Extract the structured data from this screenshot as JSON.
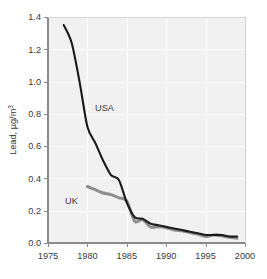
{
  "figure": {
    "background_color": "#ffffff",
    "plot_background_color": "#f1f1f1",
    "gridline_color": "#ffffff",
    "axis_color": "#8a8a8a",
    "text_color": "#3a3a3a"
  },
  "axis": {
    "y_title_main": "Lead, ",
    "y_title_unit": "µg/m",
    "y_title_exp": "3",
    "y_title_full": "Lead, µg/m3",
    "x_title": "",
    "y_ticks": [
      "1.4",
      "1.2",
      "1.0",
      "0.8",
      "0.6",
      "0.4",
      "0.2",
      "0.0"
    ],
    "x_ticks": [
      "1975",
      "1980",
      "1985",
      "1990",
      "1995",
      "2000"
    ]
  },
  "labels": {
    "usa": "USA",
    "uk": "UK"
  },
  "chart_data": {
    "type": "line",
    "title": "",
    "subtitle": "",
    "xlabel": "",
    "ylabel": "Lead, µg/m3",
    "xlim": [
      1975,
      2000
    ],
    "ylim": [
      0.0,
      1.4
    ],
    "xticks": [
      1975,
      1980,
      1985,
      1990,
      1995,
      2000
    ],
    "yticks": [
      0.0,
      0.2,
      0.4,
      0.6,
      0.8,
      1.0,
      1.2,
      1.4
    ],
    "grid": true,
    "grid_axes": "both",
    "legend": "inline-annotations",
    "annotations": [
      {
        "text": "USA",
        "x": 1981.2,
        "y": 0.8
      },
      {
        "text": "UK",
        "x": 1979.6,
        "y": 0.29
      }
    ],
    "series": [
      {
        "name": "USA",
        "color": "#1a1a1a",
        "linewidth": 2.1,
        "x": [
          1977,
          1978,
          1979,
          1980,
          1981,
          1982,
          1983,
          1984,
          1985,
          1986,
          1987,
          1988,
          1989,
          1990,
          1991,
          1992,
          1993,
          1994,
          1995,
          1996,
          1997,
          1998,
          1999
        ],
        "y": [
          1.35,
          1.24,
          1.0,
          0.72,
          0.62,
          0.51,
          0.42,
          0.39,
          0.25,
          0.16,
          0.15,
          0.12,
          0.11,
          0.1,
          0.09,
          0.08,
          0.07,
          0.06,
          0.05,
          0.05,
          0.05,
          0.04,
          0.04
        ]
      },
      {
        "name": "UK",
        "color": "#8d8d8d",
        "linewidth": 3.0,
        "x": [
          1980,
          1981,
          1982,
          1983,
          1984,
          1985,
          1986,
          1987,
          1988,
          1989,
          1990,
          1991,
          1992,
          1993,
          1994,
          1995,
          1996,
          1997,
          1998,
          1999
        ],
        "y": [
          0.35,
          0.33,
          0.31,
          0.3,
          0.28,
          0.26,
          0.135,
          0.145,
          0.1,
          0.1,
          0.095,
          0.08,
          0.075,
          0.065,
          0.055,
          0.04,
          0.05,
          0.045,
          0.035,
          0.03
        ]
      }
    ]
  }
}
